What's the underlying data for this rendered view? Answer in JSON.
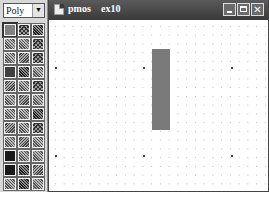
{
  "palette": {
    "layer_select": {
      "value": "Poly",
      "arrow": "▼"
    },
    "swatches": [
      [
        "pat-solid-gray selected",
        "pat-check",
        "pat-dense"
      ],
      [
        "pat-diag",
        "pat-diag",
        "pat-check"
      ],
      [
        "pat-diag",
        "pat-diag2",
        "pat-check"
      ],
      [
        "pat-solid-mid",
        "pat-dense",
        "pat-diag"
      ],
      [
        "pat-diag2",
        "pat-diag",
        "pat-check"
      ],
      [
        "pat-diag",
        "pat-diag2",
        "pat-diag"
      ],
      [
        "pat-diag",
        "pat-diag",
        "pat-dense"
      ],
      [
        "pat-diag2",
        "pat-diag",
        "pat-check"
      ],
      [
        "pat-diag",
        "pat-diag2",
        "pat-diag"
      ],
      [
        "pat-solid-dark",
        "pat-diag",
        "pat-diag"
      ],
      [
        "pat-solid-dark",
        "pat-dense",
        "pat-diag2"
      ],
      [
        "pat-diag",
        "pat-dense",
        "pat-diag"
      ]
    ]
  },
  "window": {
    "cell_name": "pmos",
    "view_name": "ex10",
    "buttons": {
      "minimize": "minimize",
      "maximize": "maximize",
      "close": "✕"
    }
  },
  "canvas": {
    "grid_minor_spacing_px": 8.75,
    "major_dots": [
      {
        "x": 6,
        "y": 47
      },
      {
        "x": 94,
        "y": 47
      },
      {
        "x": 182,
        "y": 47
      },
      {
        "x": 6,
        "y": 135
      },
      {
        "x": 94,
        "y": 135
      },
      {
        "x": 182,
        "y": 135
      }
    ],
    "shapes": [
      {
        "type": "rectangle",
        "layer": "Poly",
        "x": 103,
        "y": 29,
        "width": 18,
        "height": 81,
        "color": "#7a7a7a"
      }
    ]
  }
}
